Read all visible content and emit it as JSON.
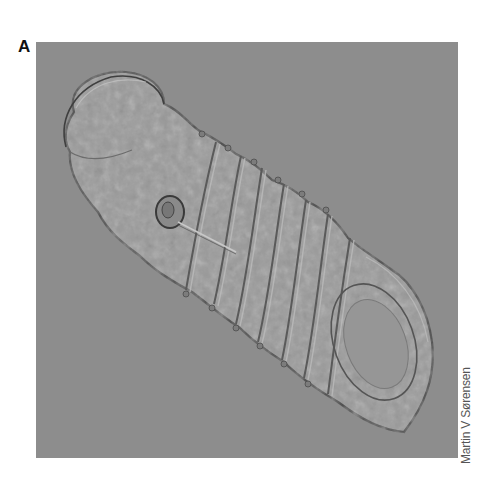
{
  "figure": {
    "panel_label": "A",
    "image_description": "Differential interference contrast micrograph of a segmented larva oriented diagonally from upper-left to lower-right on a gray background",
    "credit": "Martin V Sørensen",
    "colors": {
      "background": "#8d8d8d",
      "specimen_fill": "#9a9a9a",
      "specimen_edge": "#4a4a4a",
      "specimen_highlight": "#b8b8b8"
    }
  }
}
